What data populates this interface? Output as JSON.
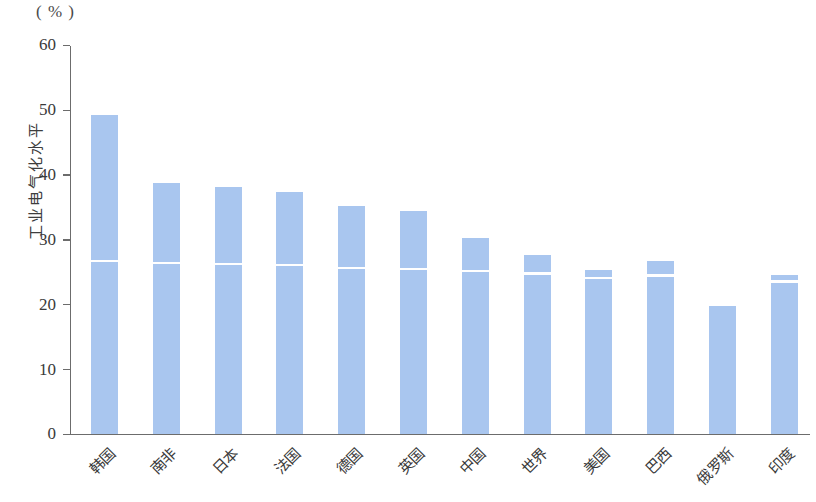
{
  "chart_data": {
    "type": "bar",
    "title": "",
    "subtitle": "",
    "unit_label": "( % )",
    "ylabel": "工业电气化水平",
    "xlabel": "",
    "ylim": [
      0,
      60
    ],
    "yticks": [
      0,
      10,
      20,
      30,
      40,
      50,
      60
    ],
    "ytick_labels": [
      "0",
      "10",
      "20",
      "30",
      "40",
      "50",
      "60"
    ],
    "grid": false,
    "legend": null,
    "categories": [
      "韩国",
      "南非",
      "日本",
      "法国",
      "德国",
      "英国",
      "中国",
      "世界",
      "美国",
      "巴西",
      "俄罗斯",
      "印度"
    ],
    "values": [
      49.1,
      38.6,
      38.0,
      37.2,
      35.1,
      34.4,
      30.1,
      27.5,
      25.2,
      26.7,
      19.7,
      24.5
    ],
    "marker_values": [
      26.4,
      26.1,
      26.0,
      25.8,
      25.4,
      25.2,
      24.9,
      24.5,
      23.8,
      24.2,
      null,
      23.3
    ],
    "bar_color": "#a9c6ef",
    "divider_color": "#ffffff",
    "axis_color": "#6c6c6c"
  },
  "axis": {
    "unit_label": "( % )",
    "y_title": "工业电气化水平"
  }
}
